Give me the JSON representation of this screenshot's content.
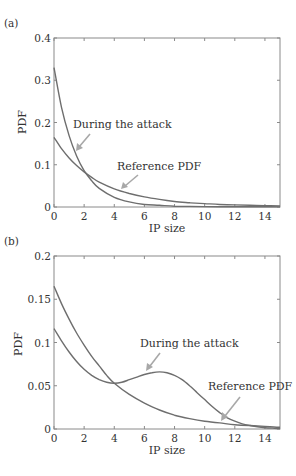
{
  "chart_data": [
    {
      "type": "line",
      "panel_label": "(a)",
      "title": "",
      "xlabel": "IP size",
      "ylabel": "PDF",
      "xlim": [
        0,
        15
      ],
      "ylim": [
        0,
        0.4
      ],
      "xticks": [
        "0",
        "2",
        "4",
        "6",
        "8",
        "10",
        "12",
        "14"
      ],
      "yticks": [
        "0",
        "0.1",
        "0.2",
        "0.3",
        "0.4"
      ],
      "grid": false,
      "legend": "none (inline annotations with arrows)",
      "series": [
        {
          "name": "During the attack",
          "x": [
            0,
            0.5,
            1,
            1.5,
            2,
            2.5,
            3,
            4,
            5,
            6,
            7,
            8,
            9,
            10,
            11,
            12,
            13,
            14,
            15
          ],
          "values": [
            0.33,
            0.236,
            0.169,
            0.121,
            0.086,
            0.062,
            0.044,
            0.023,
            0.012,
            0.006,
            0.004,
            0.002,
            0.0015,
            0.001,
            0.0008,
            0.0006,
            0.0005,
            0.0004,
            0.0003
          ]
        },
        {
          "name": "Reference PDF",
          "x": [
            0,
            0.5,
            1,
            1.5,
            2,
            2.5,
            3,
            4,
            5,
            6,
            7,
            8,
            9,
            10,
            11,
            12,
            13,
            14,
            15
          ],
          "values": [
            0.165,
            0.138,
            0.116,
            0.098,
            0.083,
            0.07,
            0.059,
            0.043,
            0.032,
            0.024,
            0.018,
            0.013,
            0.01,
            0.008,
            0.006,
            0.005,
            0.004,
            0.003,
            0.0025
          ]
        }
      ],
      "annotations": [
        {
          "text": "During the attack",
          "arrow_to_series": "During the attack",
          "arrow_target": [
            1.5,
            0.13
          ]
        },
        {
          "text": "Reference PDF",
          "arrow_to_series": "Reference PDF",
          "arrow_target": [
            4.5,
            0.045
          ]
        }
      ]
    },
    {
      "type": "line",
      "panel_label": "(b)",
      "title": "",
      "xlabel": "IP size",
      "ylabel": "PDF",
      "xlim": [
        0,
        15
      ],
      "ylim": [
        0,
        0.2
      ],
      "xticks": [
        "0",
        "2",
        "4",
        "6",
        "8",
        "10",
        "12",
        "14"
      ],
      "yticks": [
        "0",
        "0.05",
        "0.1",
        "0.15",
        "0.2"
      ],
      "grid": false,
      "legend": "none (inline annotations with arrows)",
      "series": [
        {
          "name": "During the attack",
          "x": [
            0,
            0.5,
            1,
            1.5,
            2,
            2.5,
            3,
            3.5,
            4,
            4.5,
            5,
            5.5,
            6,
            6.5,
            7,
            7.5,
            8,
            8.5,
            9,
            9.5,
            10,
            10.5,
            11,
            11.5,
            12,
            12.5,
            13,
            13.5,
            14,
            14.5,
            15
          ],
          "values": [
            0.116,
            0.102,
            0.089,
            0.078,
            0.069,
            0.062,
            0.057,
            0.054,
            0.053,
            0.054,
            0.057,
            0.06,
            0.063,
            0.065,
            0.066,
            0.065,
            0.062,
            0.057,
            0.05,
            0.042,
            0.034,
            0.026,
            0.019,
            0.013,
            0.009,
            0.006,
            0.004,
            0.0025,
            0.0015,
            0.001,
            0.0005
          ]
        },
        {
          "name": "Reference PDF",
          "x": [
            0,
            0.5,
            1,
            1.5,
            2,
            2.5,
            3,
            3.5,
            4,
            5,
            6,
            7,
            8,
            9,
            10,
            11,
            12,
            13,
            14,
            15
          ],
          "values": [
            0.165,
            0.145,
            0.127,
            0.111,
            0.097,
            0.084,
            0.073,
            0.062,
            0.053,
            0.04,
            0.03,
            0.022,
            0.016,
            0.012,
            0.009,
            0.007,
            0.005,
            0.004,
            0.003,
            0.002
          ]
        }
      ],
      "annotations": [
        {
          "text": "During the attack",
          "arrow_to_series": "During the attack",
          "arrow_target": [
            6.2,
            0.064
          ]
        },
        {
          "text": "Reference PDF",
          "arrow_to_series": "Reference PDF",
          "arrow_target": [
            11,
            0.009
          ]
        }
      ]
    }
  ],
  "style": {
    "curve_color": "#6e6e6e",
    "axis_color": "#8a8a8a",
    "arrow_color": "#a8a8a8",
    "text_color": "#333333"
  }
}
